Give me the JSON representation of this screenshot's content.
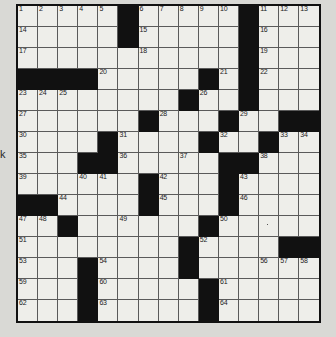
{
  "puzzle": {
    "kind": "crossword-grid",
    "rows": 15,
    "columns": 15,
    "cell_width": 20.1,
    "cell_height": 21,
    "colors": {
      "block": "#111111",
      "open": "#eeeeea",
      "grid_line": "#5a5a5a",
      "border": "#111111",
      "page_background": "#d9d9d5",
      "number_text": "#1a1a1a"
    },
    "left_margin_mark": "k",
    "blocks": [
      [
        0,
        5
      ],
      [
        0,
        11
      ],
      [
        1,
        5
      ],
      [
        1,
        11
      ],
      [
        2,
        11
      ],
      [
        3,
        0
      ],
      [
        3,
        1
      ],
      [
        3,
        2
      ],
      [
        3,
        3
      ],
      [
        3,
        9
      ],
      [
        3,
        11
      ],
      [
        4,
        8
      ],
      [
        4,
        11
      ],
      [
        5,
        6
      ],
      [
        5,
        10
      ],
      [
        5,
        13
      ],
      [
        5,
        14
      ],
      [
        6,
        4
      ],
      [
        6,
        9
      ],
      [
        6,
        12
      ],
      [
        7,
        3
      ],
      [
        7,
        4
      ],
      [
        7,
        10
      ],
      [
        7,
        11
      ],
      [
        8,
        6
      ],
      [
        8,
        10
      ],
      [
        9,
        0
      ],
      [
        9,
        1
      ],
      [
        9,
        6
      ],
      [
        9,
        10
      ],
      [
        10,
        2
      ],
      [
        10,
        9
      ],
      [
        11,
        8
      ],
      [
        11,
        13
      ],
      [
        11,
        14
      ],
      [
        12,
        3
      ],
      [
        12,
        8
      ],
      [
        13,
        3
      ],
      [
        13,
        9
      ],
      [
        14,
        3
      ],
      [
        14,
        9
      ]
    ],
    "numbers": [
      {
        "row": 0,
        "col": 0,
        "n": "1"
      },
      {
        "row": 0,
        "col": 1,
        "n": "2"
      },
      {
        "row": 0,
        "col": 2,
        "n": "3"
      },
      {
        "row": 0,
        "col": 3,
        "n": "4"
      },
      {
        "row": 0,
        "col": 4,
        "n": "5"
      },
      {
        "row": 0,
        "col": 6,
        "n": "6"
      },
      {
        "row": 0,
        "col": 7,
        "n": "7"
      },
      {
        "row": 0,
        "col": 8,
        "n": "8"
      },
      {
        "row": 0,
        "col": 9,
        "n": "9"
      },
      {
        "row": 0,
        "col": 10,
        "n": "10"
      },
      {
        "row": 0,
        "col": 12,
        "n": "11"
      },
      {
        "row": 0,
        "col": 13,
        "n": "12"
      },
      {
        "row": 0,
        "col": 14,
        "n": "13"
      },
      {
        "row": 1,
        "col": 0,
        "n": "14"
      },
      {
        "row": 1,
        "col": 6,
        "n": "15"
      },
      {
        "row": 1,
        "col": 12,
        "n": "16"
      },
      {
        "row": 2,
        "col": 0,
        "n": "17"
      },
      {
        "row": 2,
        "col": 6,
        "n": "18"
      },
      {
        "row": 2,
        "col": 12,
        "n": "19"
      },
      {
        "row": 3,
        "col": 4,
        "n": "20"
      },
      {
        "row": 3,
        "col": 10,
        "n": "21"
      },
      {
        "row": 3,
        "col": 12,
        "n": "22"
      },
      {
        "row": 4,
        "col": 0,
        "n": "23"
      },
      {
        "row": 4,
        "col": 1,
        "n": "24"
      },
      {
        "row": 4,
        "col": 2,
        "n": "25"
      },
      {
        "row": 4,
        "col": 9,
        "n": "26"
      },
      {
        "row": 5,
        "col": 0,
        "n": "27"
      },
      {
        "row": 5,
        "col": 7,
        "n": "28"
      },
      {
        "row": 5,
        "col": 11,
        "n": "29"
      },
      {
        "row": 6,
        "col": 0,
        "n": "30"
      },
      {
        "row": 6,
        "col": 5,
        "n": "31"
      },
      {
        "row": 6,
        "col": 10,
        "n": "32"
      },
      {
        "row": 6,
        "col": 13,
        "n": "33"
      },
      {
        "row": 6,
        "col": 14,
        "n": "34"
      },
      {
        "row": 7,
        "col": 0,
        "n": "35"
      },
      {
        "row": 7,
        "col": 5,
        "n": "36"
      },
      {
        "row": 7,
        "col": 8,
        "n": "37"
      },
      {
        "row": 7,
        "col": 12,
        "n": "38"
      },
      {
        "row": 8,
        "col": 0,
        "n": "39"
      },
      {
        "row": 8,
        "col": 3,
        "n": "40"
      },
      {
        "row": 8,
        "col": 4,
        "n": "41"
      },
      {
        "row": 8,
        "col": 7,
        "n": "42"
      },
      {
        "row": 8,
        "col": 11,
        "n": "43"
      },
      {
        "row": 9,
        "col": 2,
        "n": "44"
      },
      {
        "row": 9,
        "col": 7,
        "n": "45"
      },
      {
        "row": 9,
        "col": 11,
        "n": "46"
      },
      {
        "row": 10,
        "col": 0,
        "n": "47"
      },
      {
        "row": 10,
        "col": 1,
        "n": "48"
      },
      {
        "row": 10,
        "col": 5,
        "n": "49"
      },
      {
        "row": 10,
        "col": 10,
        "n": "50"
      },
      {
        "row": 11,
        "col": 0,
        "n": "51"
      },
      {
        "row": 11,
        "col": 9,
        "n": "52"
      },
      {
        "row": 12,
        "col": 0,
        "n": "53"
      },
      {
        "row": 12,
        "col": 4,
        "n": "54"
      },
      {
        "row": 12,
        "col": 8,
        "n": "55"
      },
      {
        "row": 12,
        "col": 12,
        "n": "56"
      },
      {
        "row": 12,
        "col": 13,
        "n": "57"
      },
      {
        "row": 12,
        "col": 14,
        "n": "58"
      },
      {
        "row": 13,
        "col": 0,
        "n": "59"
      },
      {
        "row": 13,
        "col": 4,
        "n": "60"
      },
      {
        "row": 13,
        "col": 10,
        "n": "61"
      },
      {
        "row": 14,
        "col": 0,
        "n": "62"
      },
      {
        "row": 14,
        "col": 4,
        "n": "63"
      },
      {
        "row": 14,
        "col": 10,
        "n": "64"
      }
    ],
    "marks": [
      {
        "row": 10,
        "col": 12,
        "kind": "pencil-dot"
      }
    ]
  }
}
